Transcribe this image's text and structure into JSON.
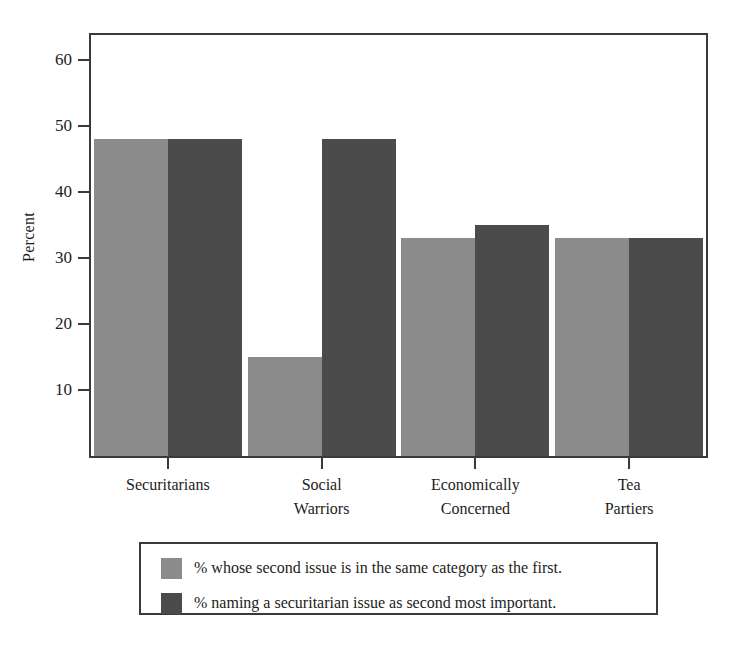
{
  "chart_data": {
    "type": "bar",
    "title": "",
    "xlabel": "",
    "ylabel": "Percent",
    "ylim": [
      0,
      63
    ],
    "yticks": [
      10,
      20,
      30,
      40,
      50,
      60
    ],
    "ytick_labels": [
      "10",
      "20",
      "30",
      "40",
      "50",
      "60"
    ],
    "grid": false,
    "legend_position": "below-axes",
    "categories": [
      "Securitarians",
      "Social Warriors",
      "Economically Concerned",
      "Tea Partiers"
    ],
    "category_lines": [
      [
        "Securitarians"
      ],
      [
        "Social",
        "Warriors"
      ],
      [
        "Economically",
        "Concerned"
      ],
      [
        "Tea",
        "Partiers"
      ]
    ],
    "series": [
      {
        "name": "% whose second issue is in the same category as the first.",
        "color": "#8b8b8b",
        "values": [
          48,
          15,
          33,
          33
        ]
      },
      {
        "name": "% naming a securitarian issue as second most important.",
        "color": "#4b4b4b",
        "values": [
          48,
          48,
          35,
          33
        ]
      }
    ]
  },
  "legend": {
    "entries": [
      {
        "label": "% whose second issue is in the same category as the first.",
        "color": "#8b8b8b"
      },
      {
        "label": "% naming a securitarian issue as second most important.",
        "color": "#4b4b4b"
      }
    ]
  },
  "colors": {
    "axis": "#3a3a3a",
    "text": "#1d1d1d",
    "background": "#ffffff",
    "series_light": "#8b8b8b",
    "series_dark": "#4b4b4b"
  }
}
